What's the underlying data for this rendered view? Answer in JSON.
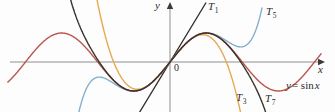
{
  "figure": {
    "background": "#fdfdfd",
    "axis_color": "#8f8f8f",
    "arrow_color": "#3a3a3a",
    "x_axis_label": "x",
    "y_axis_label": "y",
    "origin_label": "0"
  },
  "labels": {
    "t1": {
      "base": "T",
      "sub": "1"
    },
    "t3": {
      "base": "T",
      "sub": "3"
    },
    "t5": {
      "base": "T",
      "sub": "5"
    },
    "t7": {
      "base": "T",
      "sub": "7"
    },
    "sin": {
      "lhs": "y",
      "mid": "= sin",
      "rhs": "x"
    }
  },
  "chart_data": {
    "type": "line",
    "x_axis": {
      "label": "x",
      "range_radians": [
        -7.05,
        6.57
      ]
    },
    "y_axis": {
      "label": "y",
      "amplitude_units": 1
    },
    "origin_px": [
      170,
      62
    ],
    "scale_px": {
      "per_radian": 23,
      "per_unit": 29
    },
    "grid": false,
    "series": [
      {
        "id": "T1",
        "label": "T1",
        "expr": "x",
        "color": "#38322c",
        "pixel_slope": 1.65,
        "y_px_range": [
          3,
          112
        ]
      },
      {
        "id": "T3",
        "label": "T3",
        "expr": "x - x^3/6",
        "color": "#e6a84f",
        "coeffs": [
          0,
          1,
          0,
          -0.16666667
        ],
        "rad_range": [
          -3.9,
          3.35
        ]
      },
      {
        "id": "T5",
        "label": "T5",
        "expr": "x - x^3/6 + x^5/120",
        "color": "#85afcc",
        "coeffs": [
          0,
          1,
          0,
          -0.16666667,
          0,
          0.00833333
        ],
        "rad_range": [
          -4.6,
          4.0
        ]
      },
      {
        "id": "sin",
        "label": "y = sin x",
        "expr": "sin x",
        "color": "#bb544c",
        "function": "sin",
        "rad_range": [
          -7.05,
          6.57
        ]
      },
      {
        "id": "T7",
        "label": "T7",
        "expr": "x - x^3/6 + x^5/120 - x^7/5040",
        "color": "#38322c",
        "coeffs": [
          0,
          1,
          0,
          -0.16666667,
          0,
          0.00833333,
          0,
          -0.00019841269
        ],
        "rad_range": [
          -4.55,
          4.35
        ]
      }
    ]
  }
}
